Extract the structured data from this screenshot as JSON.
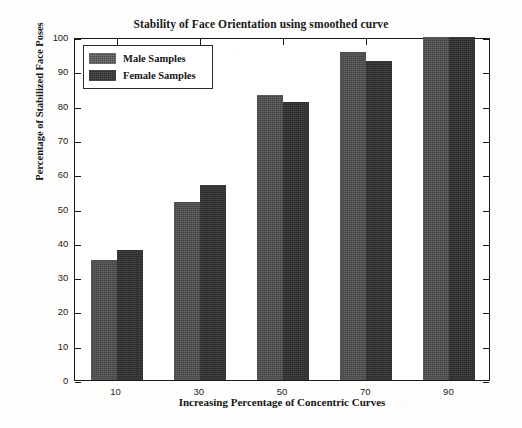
{
  "chart_data": {
    "type": "bar",
    "title": "Stability of Face Orientation using smoothed curve",
    "xlabel": "Increasing Percentage of Concentric Curves",
    "ylabel": "Percentage of Stabilized Face Poses",
    "categories": [
      "10",
      "30",
      "50",
      "70",
      "90"
    ],
    "series": [
      {
        "name": "Male Samples",
        "color": "#4d4d4d",
        "values": [
          35,
          52,
          83,
          95.5,
          100
        ]
      },
      {
        "name": "Female Samples",
        "color": "#2e2e2e",
        "values": [
          38,
          57,
          81,
          93,
          100
        ]
      }
    ],
    "ylim": [
      0,
      100
    ],
    "yticks": [
      "0",
      "10",
      "20",
      "30",
      "40",
      "50",
      "60",
      "70",
      "80",
      "90",
      "100"
    ],
    "xticks": [
      "10",
      "30",
      "50",
      "70",
      "90"
    ],
    "grid": false,
    "legend_position": "upper-left"
  },
  "legend": {
    "entries": [
      {
        "label": "Male Samples"
      },
      {
        "label": "Female Samples"
      }
    ]
  }
}
